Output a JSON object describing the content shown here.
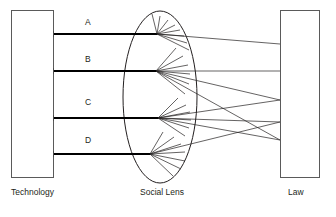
{
  "figure": {
    "type": "optical-lens-analogy-diagram",
    "background_color": "#ffffff",
    "line_color": "#231f20",
    "box_stroke_color": "#5a5a5a",
    "width": 336,
    "height": 217
  },
  "captions": {
    "left": "Technology",
    "center": "Social Lens",
    "right": "Law"
  },
  "left_block": {
    "label": "Technology",
    "x": 11,
    "y": 10,
    "width": 43,
    "height": 168
  },
  "right_block": {
    "label": "Law",
    "x": 280,
    "y": 10,
    "width": 40,
    "height": 168
  },
  "lens": {
    "label": "Social Lens",
    "center_x": 160,
    "center_y": 97,
    "radius_x": 37,
    "radius_y": 86
  },
  "input_beams": [
    {
      "label": "A",
      "y": 34,
      "x_start": 54,
      "x_end": 157,
      "label_x": 85,
      "label_y": 25
    },
    {
      "label": "B",
      "y": 71,
      "x_start": 54,
      "x_end": 156,
      "label_x": 85,
      "label_y": 62
    },
    {
      "label": "C",
      "y": 118,
      "x_start": 54,
      "x_end": 158,
      "label_x": 85,
      "label_y": 105
    },
    {
      "label": "D",
      "y": 154,
      "x_start": 54,
      "x_end": 150,
      "label_x": 85,
      "label_y": 143
    }
  ],
  "focal_points": [
    {
      "from": "A",
      "x": 157,
      "y": 34
    },
    {
      "from": "B",
      "x": 156,
      "y": 71
    },
    {
      "from": "C",
      "x": 158,
      "y": 118
    },
    {
      "from": "D",
      "x": 150,
      "y": 154
    }
  ],
  "output_targets": [
    {
      "x": 280,
      "y": 44
    },
    {
      "x": 280,
      "y": 71
    },
    {
      "x": 280,
      "y": 100
    },
    {
      "x": 280,
      "y": 122
    },
    {
      "x": 280,
      "y": 140
    }
  ],
  "fan_rays": {
    "A": [
      {
        "x": 152,
        "y": 14
      },
      {
        "x": 160,
        "y": 16
      },
      {
        "x": 168,
        "y": 20
      },
      {
        "x": 175,
        "y": 25
      },
      {
        "x": 180,
        "y": 30
      },
      {
        "x": 184,
        "y": 36
      },
      {
        "x": 187,
        "y": 43
      },
      {
        "x": 189,
        "y": 50
      }
    ],
    "B": [
      {
        "x": 176,
        "y": 48
      },
      {
        "x": 183,
        "y": 56
      },
      {
        "x": 188,
        "y": 65
      },
      {
        "x": 190,
        "y": 74
      },
      {
        "x": 189,
        "y": 84
      },
      {
        "x": 185,
        "y": 94
      }
    ],
    "C": [
      {
        "x": 178,
        "y": 98
      },
      {
        "x": 186,
        "y": 105
      },
      {
        "x": 190,
        "y": 112
      },
      {
        "x": 191,
        "y": 120
      },
      {
        "x": 189,
        "y": 128
      },
      {
        "x": 185,
        "y": 136
      }
    ],
    "D": [
      {
        "x": 163,
        "y": 132
      },
      {
        "x": 174,
        "y": 137
      },
      {
        "x": 181,
        "y": 144
      },
      {
        "x": 185,
        "y": 152
      },
      {
        "x": 185,
        "y": 161
      },
      {
        "x": 181,
        "y": 169
      },
      {
        "x": 173,
        "y": 176
      }
    ]
  },
  "box_stubs": [
    {
      "y": 34
    },
    {
      "y": 71
    },
    {
      "y": 118
    },
    {
      "y": 154
    }
  ]
}
